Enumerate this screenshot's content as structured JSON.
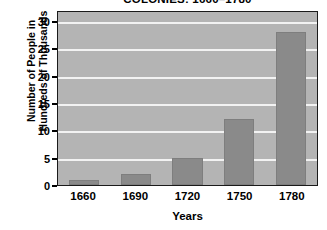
{
  "chart_data": {
    "type": "bar",
    "title": "COLONIES: 1660–1780",
    "xlabel": "Years",
    "ylabel_line1": "Number of People in",
    "ylabel_line2": "Hundreds of Thousands",
    "categories": [
      "1660",
      "1690",
      "1720",
      "1750",
      "1780"
    ],
    "values": [
      1,
      2,
      5,
      12,
      28
    ],
    "ylim": [
      0,
      32
    ],
    "yticks": [
      0,
      5,
      10,
      15,
      20,
      25,
      30
    ],
    "ytick_labels": [
      "0",
      "5",
      "10",
      "15",
      "20",
      "25",
      "30"
    ],
    "gridlines": [
      5,
      10,
      15,
      20,
      25,
      30
    ],
    "grid": true,
    "legend": false,
    "colors": {
      "bar_fill": "#8a8a8a",
      "bar_edge": "#7e7e7e",
      "plot_background": "#b4b4b4",
      "gridline": "#f2f2f2",
      "axis_border": "#1a1a1a",
      "text": "#000000",
      "figure_background": "#ffffff"
    }
  }
}
